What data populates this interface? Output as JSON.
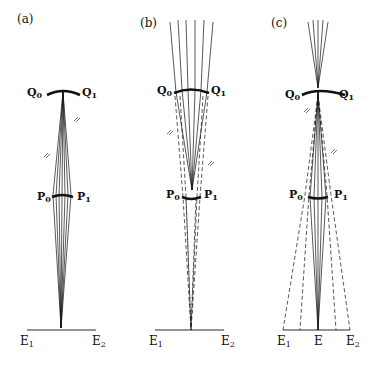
{
  "figure": {
    "panels": [
      {
        "id": "a",
        "label": "(a)",
        "mirror_labels": {
          "left": "Q",
          "left_sub": "0",
          "right": "Q",
          "right_sub": "1"
        },
        "lens_labels": {
          "left": "P",
          "left_sub": "0",
          "right": "P",
          "right_sub": "1"
        },
        "screen_labels": {
          "left": "E",
          "left_sub": "1",
          "right": "E",
          "right_sub": "2"
        }
      },
      {
        "id": "b",
        "label": "(b)",
        "mirror_labels": {
          "left": "Q",
          "left_sub": "0",
          "right": "Q",
          "right_sub": "1"
        },
        "lens_labels": {
          "left": "P",
          "left_sub": "0",
          "right": "P",
          "right_sub": "1"
        },
        "screen_labels": {
          "left": "E",
          "left_sub": "1",
          "right": "E",
          "right_sub": "2"
        }
      },
      {
        "id": "c",
        "label": "(c)",
        "mirror_labels": {
          "left": "Q",
          "left_sub": "0",
          "right": "Q",
          "right_sub": "1"
        },
        "lens_labels": {
          "left": "P",
          "left_sub": "0",
          "right": "P",
          "right_sub": "1"
        },
        "screen_labels": {
          "left": "E",
          "left_sub": "1",
          "center": "E",
          "right": "E",
          "right_sub": "2"
        }
      }
    ],
    "colors": {
      "ink": "#111111",
      "background": "#ffffff"
    }
  }
}
